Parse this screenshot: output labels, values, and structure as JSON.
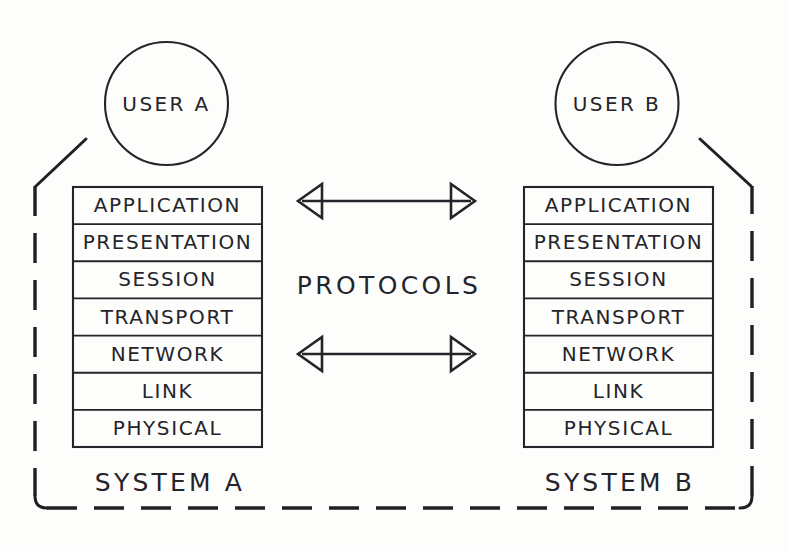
{
  "diagram": {
    "background_color": "#fdfdfc",
    "ink_color": "#24242a"
  },
  "systems": [
    {
      "id": "a",
      "user_label": "USER A",
      "system_label": "SYSTEM A"
    },
    {
      "id": "b",
      "user_label": "USER B",
      "system_label": "SYSTEM B"
    }
  ],
  "layers": [
    {
      "index": 7,
      "name": "APPLICATION"
    },
    {
      "index": 6,
      "name": "PRESENTATION"
    },
    {
      "index": 5,
      "name": "SESSION"
    },
    {
      "index": 4,
      "name": "TRANSPORT"
    },
    {
      "index": 3,
      "name": "NETWORK"
    },
    {
      "index": 2,
      "name": "LINK"
    },
    {
      "index": 1,
      "name": "PHYSICAL"
    }
  ],
  "connectors": {
    "label": "PROTOCOLS",
    "arrows": [
      {
        "id": "application-protocol-arrow",
        "aligned_layer": "APPLICATION",
        "direction": "bidirectional"
      },
      {
        "id": "network-protocol-arrow",
        "aligned_layer": "NETWORK",
        "direction": "bidirectional"
      }
    ]
  }
}
